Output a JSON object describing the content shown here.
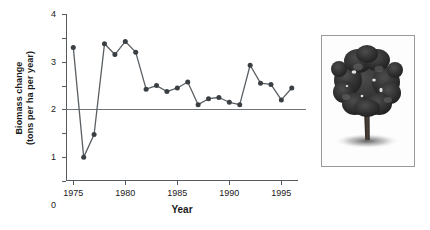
{
  "figure": {
    "photo": {
      "alt_name": "tree-photograph",
      "subject": "broadleaf tree silhouette with shadow"
    }
  },
  "chart_data": {
    "type": "line",
    "title": "",
    "xlabel": "Year",
    "ylabel": "Biomass change (tons per ha per year)",
    "ylabel_line1": "Biomass change",
    "ylabel_line2": "(tons per ha per year)",
    "xlim": [
      1974.3,
      1996.6
    ],
    "ylim": [
      -3,
      4
    ],
    "yticks": [
      4,
      3,
      2,
      1,
      0,
      -1,
      -2,
      -3
    ],
    "ytick_labels": [
      "4",
      "3",
      "2",
      "1",
      "0",
      "1",
      "2",
      "3"
    ],
    "xticks": [
      1975,
      1980,
      1985,
      1990,
      1995
    ],
    "xtick_labels": [
      "1975",
      "1980",
      "1985",
      "1990",
      "1995"
    ],
    "grid": false,
    "legend": "none",
    "zero_line": true,
    "marker": "filled-circle",
    "line_color": "#5a5f63",
    "marker_color": "#3a3f43",
    "axis_color": "#555a5e",
    "x": [
      1975,
      1976,
      1977,
      1978,
      1979,
      1980,
      1981,
      1982,
      1983,
      1984,
      1985,
      1986,
      1987,
      1988,
      1989,
      1990,
      1991,
      1992,
      1993,
      1994,
      1995,
      1996
    ],
    "values": [
      2.6,
      -2.0,
      -1.05,
      2.75,
      2.3,
      2.85,
      2.4,
      0.85,
      1.0,
      0.75,
      0.9,
      1.15,
      0.2,
      0.45,
      0.5,
      0.3,
      0.2,
      1.85,
      1.1,
      1.05,
      0.4,
      0.9
    ]
  }
}
